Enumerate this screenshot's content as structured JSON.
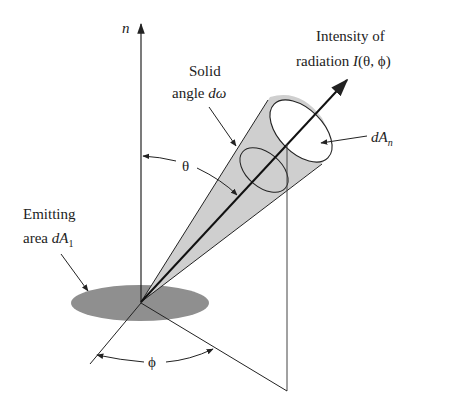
{
  "diagram": {
    "labels": {
      "normal_axis": "n",
      "solid_angle_line1": "Solid",
      "solid_angle_line2_text": "angle ",
      "solid_angle_symbol": "dω",
      "intensity_line1": "Intensity of",
      "intensity_line2_text": "radiation ",
      "intensity_symbol": "I",
      "intensity_args": "(θ, ϕ)",
      "dAn_main": "dA",
      "dAn_sub": "n",
      "emitting_line1": "Emitting",
      "emitting_line2_text": "area ",
      "emitting_symbol_main": "dA",
      "emitting_symbol_sub": "1",
      "theta": "θ",
      "phi": "ϕ"
    },
    "colors": {
      "line": "#222222",
      "cone_fill": "#cfcfcf",
      "emitting_area_fill": "#8f8f8f",
      "background": "#ffffff"
    }
  }
}
